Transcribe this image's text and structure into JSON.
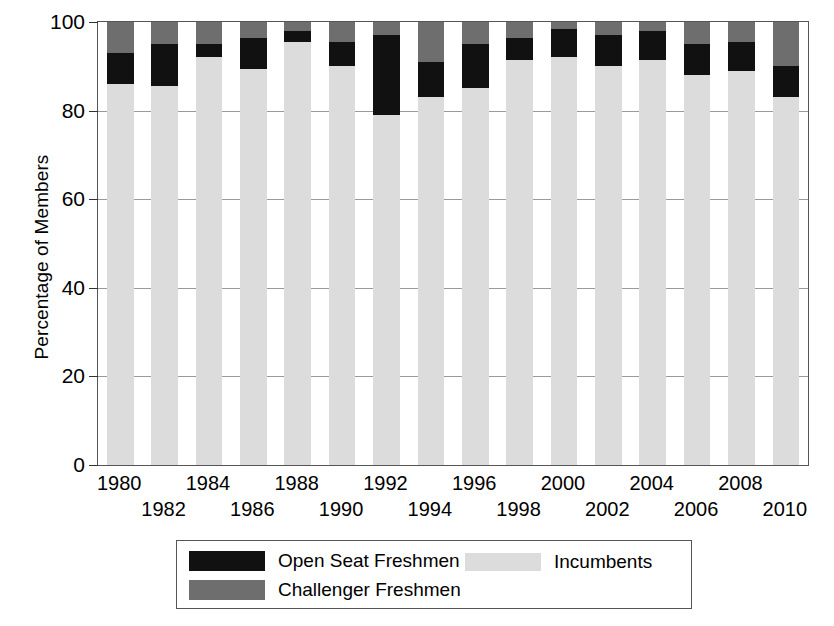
{
  "chart_data": {
    "type": "bar",
    "subtype": "stacked-bar",
    "title": "",
    "xlabel": "",
    "ylabel": "Percentage of Members",
    "ylim": [
      0,
      100
    ],
    "yticks": [
      0,
      20,
      40,
      60,
      80,
      100
    ],
    "ytick_labels": [
      "0",
      "20",
      "40",
      "60",
      "80",
      "100"
    ],
    "grid": true,
    "grid_axis": "y",
    "legend_position": "bottom",
    "categories": [
      "1980",
      "1982",
      "1984",
      "1986",
      "1988",
      "1990",
      "1992",
      "1994",
      "1996",
      "1998",
      "2000",
      "2002",
      "2004",
      "2006",
      "2008",
      "2010"
    ],
    "series": [
      {
        "name": "Incumbents",
        "color": "#dcdcdc",
        "values": [
          86,
          85.5,
          92,
          89.5,
          95.5,
          90,
          79,
          83,
          85,
          91.5,
          92,
          90,
          91.5,
          88,
          89,
          83
        ]
      },
      {
        "name": "Open Seat Freshmen",
        "color": "#111111",
        "values": [
          7,
          9.5,
          3,
          7,
          2.5,
          5.5,
          18,
          8,
          10,
          5,
          6.5,
          7,
          6.5,
          7,
          6.5,
          7
        ]
      },
      {
        "name": "Challenger Freshmen",
        "color": "#6e6e6e",
        "values": [
          7,
          5,
          5,
          3.5,
          2,
          4.5,
          3,
          9,
          5,
          3.5,
          1.5,
          3,
          2,
          5,
          4.5,
          10
        ]
      }
    ]
  },
  "axes": {
    "y_title": "Percentage of Members"
  },
  "legend": {
    "items": [
      {
        "label": "Open Seat Freshmen",
        "color": "#111111"
      },
      {
        "label": "Challenger Freshmen",
        "color": "#6e6e6e"
      },
      {
        "label": "Incumbents",
        "color": "#dcdcdc"
      }
    ]
  }
}
